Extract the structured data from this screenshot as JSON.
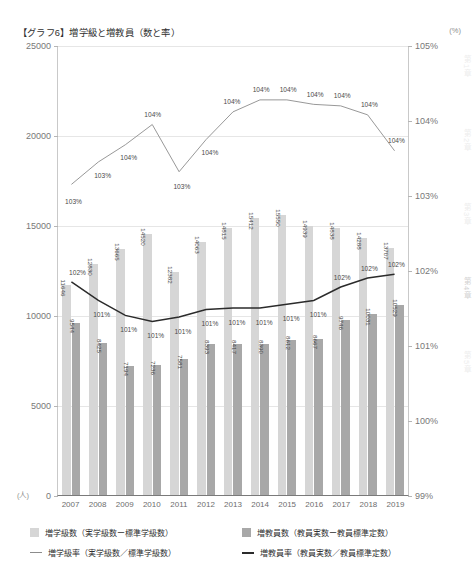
{
  "header": {
    "title": "【グラフ6】増学級と増教員（数と率）",
    "unit_right": "(%)",
    "unit_left": "(人)"
  },
  "axes": {
    "left_ticks": [
      "25000",
      "20000",
      "15000",
      "10000",
      "5000",
      "0"
    ],
    "right_ticks": [
      "105%",
      "104%",
      "103%",
      "102%",
      "101%",
      "100%",
      "99%"
    ]
  },
  "legend": {
    "items": [
      {
        "marker": "swatch-light",
        "label": "増学級数（実学級数ー標準学級数）"
      },
      {
        "marker": "swatch-dark",
        "label": "増教員数（教員実数ー教員標準定数）"
      },
      {
        "marker": "line-thin",
        "label": "増学級率（実学級数／標準学級数）"
      },
      {
        "marker": "line-thick",
        "label": "増教員率（教員実数／教員標準定数）"
      }
    ]
  },
  "chapters": [
    {
      "label": "第1章",
      "active": false
    },
    {
      "label": "第2章",
      "active": false
    },
    {
      "label": "第3章",
      "active": false
    },
    {
      "label": "第4章",
      "active": true
    },
    {
      "label": "第5章",
      "active": false
    }
  ],
  "chart_data": {
    "type": "bar",
    "title": "【グラフ6】増学級と増教員（数と率）",
    "xlabel": "",
    "ylabel": "(人)",
    "y2label": "(%)",
    "ylim": [
      0,
      25000
    ],
    "y2lim": [
      99,
      105
    ],
    "grid": true,
    "legend_position": "bottom",
    "categories": [
      "2007",
      "2008",
      "2009",
      "2010",
      "2011",
      "2012",
      "2013",
      "2014",
      "2015",
      "2016",
      "2017",
      "2018",
      "2019"
    ],
    "series": [
      {
        "name": "増学級数（実学級数ー標準学級数）",
        "type": "bar",
        "axis": "left",
        "color": "#d6d6d6",
        "values": [
          11646,
          12830,
          13665,
          14520,
          12382,
          14063,
          14815,
          15412,
          15550,
          14939,
          14838,
          14288,
          13707
        ],
        "labels": [
          "11646",
          "12830",
          "13665",
          "14520",
          "12382",
          "14063",
          "14815",
          "15412",
          "15550",
          "14939",
          "14838",
          "14288",
          "13707"
        ]
      },
      {
        "name": "増教員数（教員実数ー教員標準定数）",
        "type": "bar",
        "axis": "left",
        "color": "#a8a8a8",
        "values": [
          9544,
          8425,
          7194,
          7236,
          7581,
          8393,
          8417,
          8390,
          8612,
          8667,
          9746,
          10031,
          10529
        ],
        "labels": [
          "9544",
          "8425",
          "7194",
          "7236",
          "7581",
          "8393",
          "8417",
          "8390",
          "8612",
          "8667",
          "9746",
          "10031",
          "10529"
        ]
      },
      {
        "name": "増学級率（実学級数／標準学級数）",
        "type": "line",
        "axis": "right",
        "color": "#8c8c8c",
        "values": [
          103.15,
          103.45,
          103.68,
          103.95,
          103.32,
          103.75,
          104.12,
          104.28,
          104.28,
          104.22,
          104.2,
          104.08,
          103.6
        ],
        "labels": [
          "103%",
          "103%",
          "104%",
          "104%",
          "103%",
          "104%",
          "104%",
          "104%",
          "104%",
          "104%",
          "104%",
          "104%",
          "104%"
        ]
      },
      {
        "name": "増教員率（教員実数／教員標準定数）",
        "type": "line",
        "axis": "right",
        "color": "#2b2b2b",
        "values": [
          101.85,
          101.6,
          101.4,
          101.32,
          101.38,
          101.48,
          101.5,
          101.5,
          101.55,
          101.6,
          101.78,
          101.9,
          101.95
        ],
        "labels": [
          "102%",
          "101%",
          "101%",
          "101%",
          "101%",
          "101%",
          "101%",
          "101%",
          "101%",
          "101%",
          "102%",
          "102%",
          "102%"
        ]
      }
    ]
  }
}
